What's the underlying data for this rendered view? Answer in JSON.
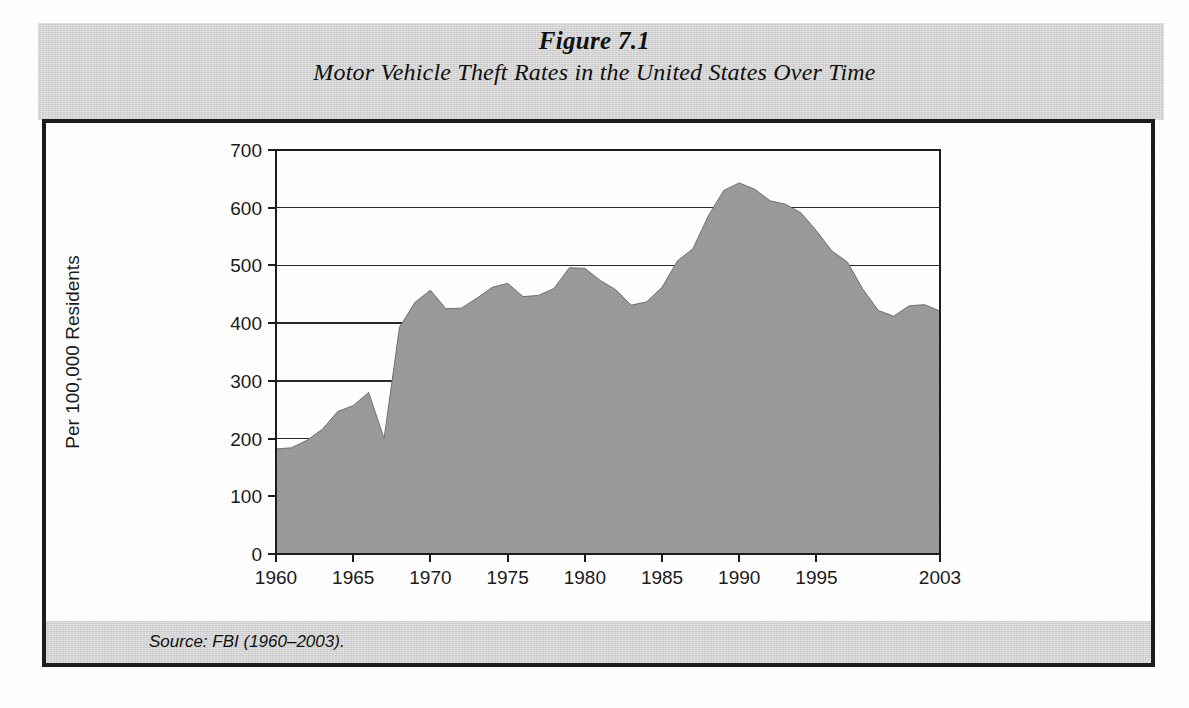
{
  "figure": {
    "number_label": "Figure 7.1",
    "title": "Motor Vehicle Theft Rates in the United States Over Time",
    "source_note": "Source: FBI (1960–2003).",
    "band_color": "#d6d6d6",
    "frame_color": "#1c1c1c",
    "fill_color": "#9a9a9a"
  },
  "chart_data": {
    "type": "area",
    "title": "Motor Vehicle Theft Rates in the United States Over Time",
    "xlabel": "",
    "ylabel": "Per 100,000 Residents",
    "xlim": [
      1960,
      2003
    ],
    "ylim": [
      0,
      700
    ],
    "grid": true,
    "legend": null,
    "y_ticks": [
      0,
      100,
      200,
      300,
      400,
      500,
      600,
      700
    ],
    "y_tick_labels": [
      "0",
      "100",
      "200",
      "300",
      "400",
      "500",
      "600",
      "700"
    ],
    "x_ticks": [
      1960,
      1965,
      1970,
      1975,
      1980,
      1985,
      1990,
      1995,
      2003
    ],
    "x_tick_labels": [
      "1960",
      "1965",
      "1970",
      "1975",
      "1980",
      "1985",
      "1990",
      "1995",
      "2003"
    ],
    "series": [
      {
        "name": "Motor vehicle theft rate per 100,000 residents",
        "x": [
          1960,
          1961,
          1962,
          1963,
          1964,
          1965,
          1966,
          1967,
          1968,
          1969,
          1970,
          1971,
          1972,
          1973,
          1974,
          1975,
          1976,
          1977,
          1978,
          1979,
          1980,
          1981,
          1982,
          1983,
          1984,
          1985,
          1986,
          1987,
          1988,
          1989,
          1990,
          1991,
          1992,
          1993,
          1994,
          1995,
          1996,
          1997,
          1998,
          1999,
          2000,
          2001,
          2002,
          2003
        ],
        "values": [
          182,
          184,
          197,
          216,
          247,
          257,
          280,
          200,
          393,
          436,
          457,
          425,
          426,
          443,
          462,
          469,
          446,
          448,
          460,
          496,
          495,
          474,
          458,
          431,
          437,
          462,
          508,
          529,
          586,
          630,
          643,
          632,
          612,
          606,
          591,
          560,
          525,
          506,
          459,
          422,
          412,
          430,
          432,
          421
        ]
      }
    ]
  }
}
